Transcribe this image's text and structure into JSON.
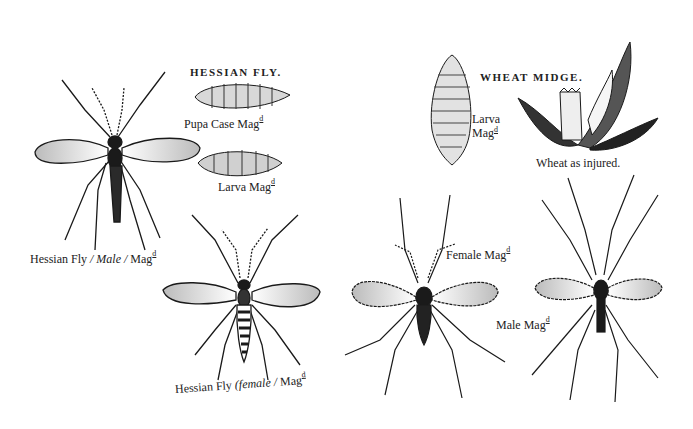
{
  "plate": {
    "sections": [
      {
        "title": "HESSIAN FLY.",
        "figures": [
          {
            "id": "pupa-case",
            "caption": "Pupa Case Mag",
            "sup": "d"
          },
          {
            "id": "larva",
            "caption": "Larva Mag",
            "sup": "d"
          },
          {
            "id": "male",
            "caption_pre": "Hessian Fly ",
            "caption_em": "/ Male /",
            "caption_post": " Mag",
            "sup": "d"
          },
          {
            "id": "female",
            "caption_pre": "Hessian Fly ",
            "caption_em": "(female /",
            "caption_post": " Mag",
            "sup": "d"
          }
        ]
      },
      {
        "title": "WHEAT MIDGE.",
        "figures": [
          {
            "id": "larva",
            "caption_line1": "Larva",
            "caption_line2": "Mag",
            "sup": "d"
          },
          {
            "id": "wheat",
            "caption": "Wheat as injured."
          },
          {
            "id": "female",
            "caption": "Female Mag",
            "sup": "d"
          },
          {
            "id": "male",
            "caption": "Male Mag",
            "sup": "d"
          }
        ]
      }
    ],
    "colors": {
      "ink": "#1a1a1a",
      "paper": "#ffffff",
      "shade": "#8a8a8a"
    }
  }
}
